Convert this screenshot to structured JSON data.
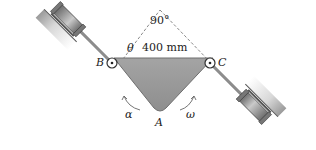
{
  "diagram": {
    "type": "mechanism",
    "labels": {
      "point_b": "B",
      "point_c": "C",
      "point_a": "A",
      "angle_top": "90°",
      "angle_theta": "θ",
      "dimension": "400 mm",
      "angular_accel": "α",
      "angular_vel": "ω"
    },
    "colors": {
      "plate": "#9a9a9a",
      "plate_edge": "#6e6e6e",
      "line": "#333333",
      "dashed": "#888888",
      "cylinder": "#8c8c8c",
      "wall": "#c8c8c8"
    }
  }
}
